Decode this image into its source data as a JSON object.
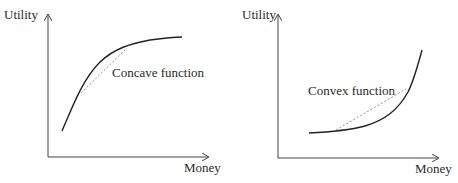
{
  "diagrams": [
    {
      "id": "left",
      "y_label": "Utility",
      "x_label": "Money",
      "curve_label": "Concave function",
      "curve_type": "concave"
    },
    {
      "id": "right",
      "y_label": "Utility",
      "x_label": "Money",
      "curve_label": "Convex function",
      "curve_type": "convex"
    }
  ],
  "colors": {
    "axis": "#444444",
    "curve": "#222222",
    "chord": "#777777",
    "text": "#2a2a2a"
  }
}
